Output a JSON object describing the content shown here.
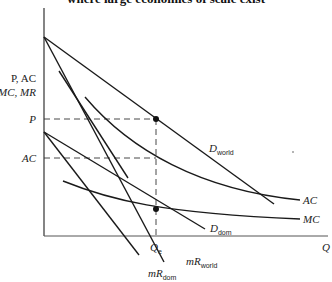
{
  "title": "where large economies of scale exist",
  "axes": {
    "y_label_line1": "P, AC",
    "y_label_line2": "MC, MR",
    "x_label": "Q"
  },
  "levels": {
    "p_label": "P",
    "ac_label": "AC",
    "qe_label": "Q",
    "qe_sub": "e"
  },
  "curves": {
    "d_world": {
      "main": "D",
      "sub": "world"
    },
    "mr_world": {
      "main": "mR",
      "sub": "world"
    },
    "d_dom": {
      "main": "D",
      "sub": "dom"
    },
    "mr_dom": {
      "main": "mR",
      "sub": "dom"
    },
    "ac": "AC",
    "mc": "MC"
  },
  "colors": {
    "line": "#1a1a1a",
    "background": "#ffffff"
  }
}
